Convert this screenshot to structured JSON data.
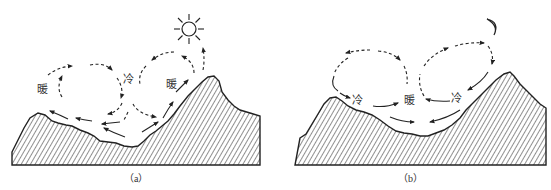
{
  "panels": [
    {
      "id": "a",
      "caption": "（a）",
      "celestial": "sun-icon",
      "labels": [
        {
          "text": "暖",
          "role": "warm-left"
        },
        {
          "text": "冷",
          "role": "cold-center"
        },
        {
          "text": "暖",
          "role": "warm-right"
        }
      ],
      "description": "Daytime valley breeze: air rises along sunlit slopes (warm), sinks over valley center (cold)"
    },
    {
      "id": "b",
      "caption": "（b）",
      "celestial": "moon-icon",
      "labels": [
        {
          "text": "冷",
          "role": "cold-left"
        },
        {
          "text": "暖",
          "role": "warm-center"
        },
        {
          "text": "冷",
          "role": "cold-right"
        }
      ],
      "description": "Nighttime mountain breeze: cold air drains down slopes, warm air rises over valley center"
    }
  ],
  "colors": {
    "line": "#222222",
    "background": "#ffffff",
    "text": "#333333"
  }
}
